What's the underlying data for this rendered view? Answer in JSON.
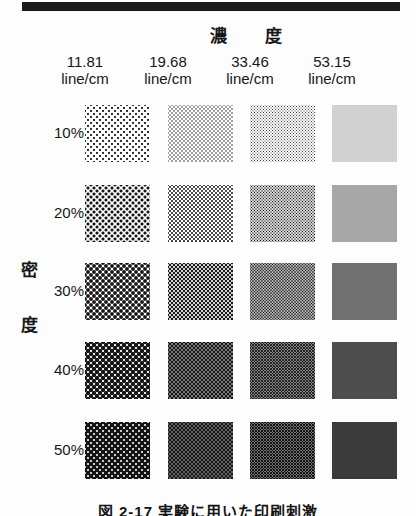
{
  "figure": {
    "kind": "halftone-test-chart",
    "column_axis_title": "濃  度",
    "row_axis_title_chars": [
      "密",
      "度"
    ],
    "caption": "図 2-17  実験に用いた印刷刺激",
    "top_rule_color": "#1b1b1b",
    "background_color": "#fdfdfd",
    "ink_color": "#141414"
  },
  "columns": [
    {
      "value": "11.81",
      "unit": "line/cm"
    },
    {
      "value": "19.68",
      "unit": "line/cm"
    },
    {
      "value": "33.46",
      "unit": "line/cm"
    },
    {
      "value": "53.15",
      "unit": "line/cm"
    }
  ],
  "rows": [
    {
      "label": "10%"
    },
    {
      "label": "20%"
    },
    {
      "label": "30%"
    },
    {
      "label": "40%"
    },
    {
      "label": "50%"
    }
  ],
  "chart_data": {
    "type": "table",
    "xlabel": "濃  度",
    "ylabel": "密  度",
    "categories": [
      "11.81 line/cm",
      "19.68 line/cm",
      "33.46 line/cm",
      "53.15 line/cm"
    ],
    "row_categories": [
      "10%",
      "20%",
      "30%",
      "40%",
      "50%"
    ],
    "series": [
      {
        "name": "10%",
        "values": [
          10,
          10,
          10,
          10
        ]
      },
      {
        "name": "20%",
        "values": [
          20,
          20,
          20,
          20
        ]
      },
      {
        "name": "30%",
        "values": [
          30,
          30,
          30,
          30
        ]
      },
      {
        "name": "40%",
        "values": [
          40,
          40,
          40,
          40
        ]
      },
      {
        "name": "50%",
        "values": [
          50,
          50,
          50,
          50
        ]
      }
    ],
    "cell_unit": "dot area coverage %"
  },
  "patch_grid": {
    "screen_pitch_px": [
      6,
      4,
      3,
      2
    ],
    "cells": [
      [
        {
          "coverage": 10,
          "pitch": 6
        },
        {
          "coverage": 10,
          "pitch": 4
        },
        {
          "coverage": 10,
          "pitch": 3
        },
        {
          "coverage": 10,
          "pitch": 2
        }
      ],
      [
        {
          "coverage": 20,
          "pitch": 6
        },
        {
          "coverage": 20,
          "pitch": 4
        },
        {
          "coverage": 20,
          "pitch": 3
        },
        {
          "coverage": 20,
          "pitch": 2
        }
      ],
      [
        {
          "coverage": 30,
          "pitch": 6
        },
        {
          "coverage": 30,
          "pitch": 4
        },
        {
          "coverage": 30,
          "pitch": 3
        },
        {
          "coverage": 30,
          "pitch": 2
        }
      ],
      [
        {
          "coverage": 40,
          "pitch": 6
        },
        {
          "coverage": 40,
          "pitch": 4
        },
        {
          "coverage": 40,
          "pitch": 3
        },
        {
          "coverage": 40,
          "pitch": 2
        }
      ],
      [
        {
          "coverage": 50,
          "pitch": 6
        },
        {
          "coverage": 50,
          "pitch": 4
        },
        {
          "coverage": 50,
          "pitch": 3
        },
        {
          "coverage": 50,
          "pitch": 2
        }
      ]
    ],
    "column_x": [
      85,
      168,
      250,
      332
    ],
    "row_y": [
      105,
      185,
      263,
      342,
      422
    ]
  }
}
